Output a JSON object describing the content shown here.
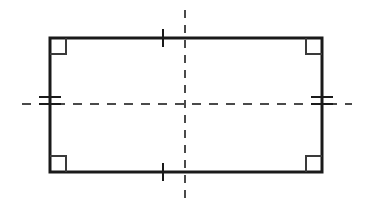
{
  "figure": {
    "background_color": "#ffffff",
    "stroke_color": "#1a1a1a",
    "dash_color": "#4a4a4a"
  },
  "rectangle": {
    "name": "rectangle-shape",
    "x": 50,
    "y": 38,
    "width": 272,
    "height": 134,
    "stroke_width": 3,
    "fill": "none"
  },
  "right_angle_markers": [
    {
      "label": "top-left",
      "x": 50,
      "y": 38,
      "size": 16,
      "dx": 1,
      "dy": 1
    },
    {
      "label": "top-right",
      "x": 322,
      "y": 38,
      "size": 16,
      "dx": -1,
      "dy": 1
    },
    {
      "label": "bottom-left",
      "x": 50,
      "y": 172,
      "size": 16,
      "dx": 1,
      "dy": -1
    },
    {
      "label": "bottom-right",
      "x": 322,
      "y": 172,
      "size": 16,
      "dx": -1,
      "dy": -1
    }
  ],
  "tick_marks": {
    "horizontal_sides": {
      "label": "single-tick",
      "count": 1,
      "x": 163,
      "half_length": 9,
      "top_y": 38,
      "bottom_y": 172,
      "stroke_width": 2
    },
    "vertical_sides": {
      "label": "double-tick",
      "count": 2,
      "y_offsets": [
        -7,
        0
      ],
      "center_y": 104,
      "half_length": 11,
      "left_x": 50,
      "right_x": 322,
      "stroke_width": 2
    }
  },
  "symmetry_lines": [
    {
      "name": "vertical-symmetry-line",
      "orientation": "vertical",
      "x": 185,
      "y1": 10,
      "y2": 201,
      "dash": "8 7",
      "stroke_width": 2
    },
    {
      "name": "horizontal-symmetry-line",
      "orientation": "horizontal",
      "y": 104,
      "x1": 22,
      "x2": 352,
      "dash": "9 8",
      "stroke_width": 2
    }
  ],
  "chart_data": {
    "type": "diagram",
    "shape": "rectangle",
    "lines_of_symmetry": 2,
    "right_angles": 4,
    "congruent_side_pairs": [
      {
        "sides": "top-and-bottom",
        "tick_count": 1
      },
      {
        "sides": "left-and-right",
        "tick_count": 2
      }
    ]
  }
}
